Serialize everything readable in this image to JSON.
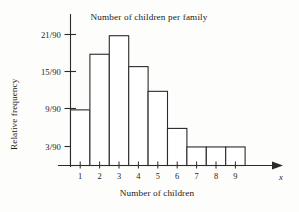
{
  "chart_data": {
    "type": "bar",
    "title": "Number of children per family",
    "xlabel": "Number of children",
    "ylabel": "Relative frequency",
    "x_axis_variable": "x",
    "categories": [
      "1",
      "2",
      "3",
      "4",
      "5",
      "6",
      "7",
      "8",
      "9"
    ],
    "values": [
      9,
      18,
      21,
      16,
      12,
      6,
      3,
      3,
      3
    ],
    "value_labels": [
      "9/90",
      "18/90",
      "21/90",
      "16/90",
      "12/90",
      "6/90",
      "3/90",
      "3/90",
      "3/90"
    ],
    "denominator": 90,
    "y_tick_labels": [
      "3/90",
      "9/90",
      "15/90",
      "21/90"
    ],
    "y_tick_values": [
      3,
      9,
      15,
      21
    ],
    "x_tick_labels": [
      "1",
      "2",
      "3",
      "4",
      "5",
      "6",
      "7",
      "8",
      "9"
    ],
    "ylim": [
      0,
      24
    ],
    "xlim": [
      0.5,
      9.5
    ],
    "grid": false,
    "legend": "none",
    "bar_style": "outline",
    "bar_edge_color": "#2b2b2b",
    "bar_fill_color": "#ffffff",
    "axis_color": "#2b2b2b",
    "background_color": "#fdfdfb",
    "note": "Histogram of relative frequencies; bars span half-integer boundaries centred on each integer category."
  },
  "figure": {
    "title": "Number of children per family",
    "y_axis_title": "Relative frequency",
    "x_axis_title": "Number of children",
    "x_axis_variable": "x"
  }
}
